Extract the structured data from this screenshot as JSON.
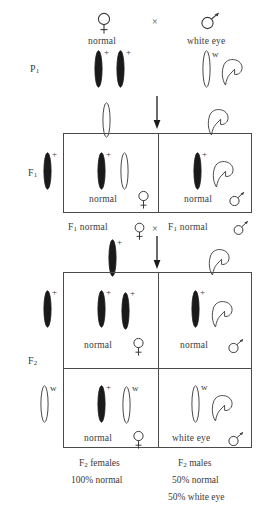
{
  "figure": {
    "type": "genetics-cross-diagram",
    "organism_trait": "Drosophila white eye X-linked inheritance"
  },
  "generations": {
    "p1_label": "P",
    "p1_sub": "1",
    "f1_label": "F",
    "f1_sub": "1",
    "f2_label": "F",
    "f2_sub": "2"
  },
  "parental": {
    "female": {
      "sex_icon": "female-symbol",
      "phenotype": "normal",
      "alleles": [
        "+",
        "+"
      ],
      "chromosome_fill": [
        "filled",
        "filled"
      ]
    },
    "cross_symbol": "×",
    "male": {
      "sex_icon": "male-symbol",
      "phenotype": "white eye",
      "alleles": [
        "w"
      ],
      "chromosome_fill": [
        "open"
      ],
      "y_chromosome": "hook"
    }
  },
  "f1_cross": {
    "left_text": "F",
    "left_sub": "1",
    "left_phenotype": "normal",
    "left_sex_icon": "female-symbol",
    "cross_symbol": "×",
    "right_text": "F",
    "right_sub": "1",
    "right_phenotype": "normal",
    "right_sex_icon": "male-symbol"
  },
  "f1_box": {
    "maternal_gamete": {
      "allele": "+",
      "fill": "filled"
    },
    "paternal_gametes": [
      {
        "allele": "",
        "fill": "open",
        "shape": "x"
      },
      {
        "allele": "",
        "fill": "open",
        "shape": "y-hook"
      }
    ],
    "cells": [
      {
        "id": "f1-female",
        "chromosomes": [
          {
            "allele": "+",
            "fill": "filled",
            "shape": "x"
          },
          {
            "allele": "",
            "fill": "open",
            "shape": "x"
          }
        ],
        "phenotype": "normal",
        "sex_icon": "female-symbol"
      },
      {
        "id": "f1-male",
        "chromosomes": [
          {
            "allele": "+",
            "fill": "filled",
            "shape": "x"
          },
          {
            "allele": "",
            "fill": "open",
            "shape": "y-hook"
          }
        ],
        "phenotype": "normal",
        "sex_icon": "male-symbol"
      }
    ]
  },
  "f2_box": {
    "maternal_gametes": [
      {
        "allele": "+",
        "fill": "filled"
      },
      {
        "allele": "w",
        "fill": "open"
      }
    ],
    "paternal_gametes": [
      {
        "allele": "+",
        "fill": "filled",
        "shape": "x"
      },
      {
        "allele": "",
        "fill": "open",
        "shape": "y-hook"
      }
    ],
    "cells": [
      {
        "id": "f2-normal-female-homozygous",
        "chromosomes": [
          {
            "allele": "+",
            "fill": "filled",
            "shape": "x"
          },
          {
            "allele": "+",
            "fill": "filled",
            "shape": "x"
          }
        ],
        "phenotype": "normal",
        "sex_icon": "female-symbol"
      },
      {
        "id": "f2-normal-male",
        "chromosomes": [
          {
            "allele": "+",
            "fill": "filled",
            "shape": "x"
          },
          {
            "allele": "",
            "fill": "open",
            "shape": "y-hook"
          }
        ],
        "phenotype": "normal",
        "sex_icon": "male-symbol"
      },
      {
        "id": "f2-carrier-female",
        "chromosomes": [
          {
            "allele": "+",
            "fill": "filled",
            "shape": "x"
          },
          {
            "allele": "w",
            "fill": "open",
            "shape": "x"
          }
        ],
        "phenotype": "normal",
        "sex_icon": "female-symbol"
      },
      {
        "id": "f2-white-eye-male",
        "chromosomes": [
          {
            "allele": "w",
            "fill": "open",
            "shape": "x"
          },
          {
            "allele": "",
            "fill": "open",
            "shape": "y-hook"
          }
        ],
        "phenotype": "white eye",
        "sex_icon": "male-symbol"
      }
    ]
  },
  "summary": {
    "females_label": "F",
    "females_sub": "2",
    "females_label_rest": " females",
    "females_ratio": "100% normal",
    "males_label": "F",
    "males_sub": "2",
    "males_label_rest": " males",
    "males_ratio_1": "50% normal",
    "males_ratio_2": "50% white eye"
  },
  "colors": {
    "line": "#4a4a4a",
    "text": "#3a3a3a",
    "chromosome_filled": "#1a1a1a",
    "chromosome_open": "#ffffff",
    "background": "#ffffff"
  }
}
